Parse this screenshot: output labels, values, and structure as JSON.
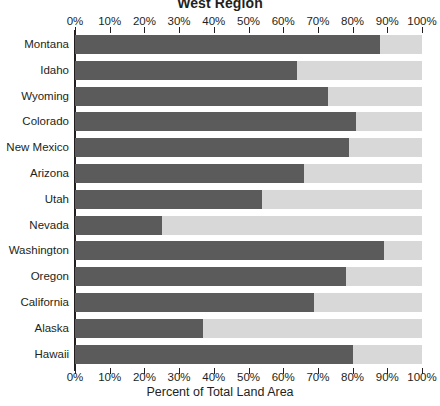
{
  "chart_data": {
    "type": "bar",
    "orientation": "horizontal",
    "stacked": true,
    "title": "West Region",
    "xlabel": "Percent of Total Land Area",
    "ylabel": "",
    "xlim": [
      0,
      100
    ],
    "grid": false,
    "legend": "none",
    "tick_labels": [
      "0%",
      "10%",
      "20%",
      "30%",
      "40%",
      "50%",
      "60%",
      "70%",
      "80%",
      "90%",
      "100%"
    ],
    "tick_values": [
      0,
      10,
      20,
      30,
      40,
      50,
      60,
      70,
      80,
      90,
      100
    ],
    "categories": [
      "Montana",
      "Idaho",
      "Wyoming",
      "Colorado",
      "New Mexico",
      "Arizona",
      "Utah",
      "Nevada",
      "Washington",
      "Oregon",
      "California",
      "Alaska",
      "Hawaii"
    ],
    "series": [
      {
        "name": "Percent of Total Land Area",
        "color": "#5b5b5b",
        "values": [
          88,
          64,
          73,
          81,
          79,
          66,
          54,
          25,
          89,
          78,
          69,
          37,
          80
        ]
      },
      {
        "name": "Remainder",
        "color": "#d8d8d8",
        "values": [
          12,
          36,
          27,
          19,
          21,
          34,
          46,
          75,
          11,
          22,
          31,
          63,
          20
        ]
      }
    ],
    "colors": {
      "bar": "#5b5b5b",
      "track": "#d8d8d8",
      "axis": "#231f20",
      "text": "#231f20",
      "background": "#ffffff"
    }
  }
}
